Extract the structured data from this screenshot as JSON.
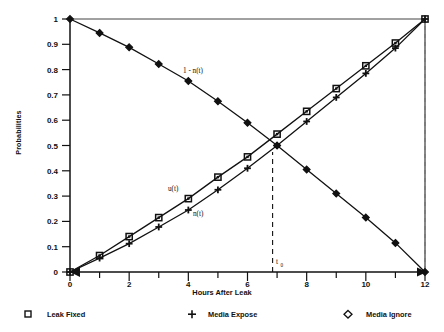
{
  "chart_data": {
    "type": "line",
    "title": "",
    "xlabel": "Hours After Leak",
    "ylabel": "Probabilities",
    "xlim": [
      0,
      12
    ],
    "ylim": [
      0,
      1
    ],
    "grid": false,
    "xticks": [
      0,
      1,
      2,
      3,
      4,
      5,
      6,
      7,
      8,
      9,
      10,
      11,
      12
    ],
    "xtick_labels": [
      "0",
      "",
      "2",
      "",
      "4",
      "",
      "6",
      "",
      "8",
      "",
      "10",
      "",
      "12"
    ],
    "yticks": [
      0,
      0.1,
      0.2,
      0.3,
      0.4,
      0.5,
      0.6,
      0.7,
      0.8,
      0.9,
      1
    ],
    "ytick_labels": [
      "0",
      "0.1",
      "0.2",
      "0.3",
      "0.4",
      "0.5",
      "0.6",
      "0.7",
      "0.8",
      "0.9",
      "1"
    ],
    "x": [
      0,
      1,
      2,
      3,
      4,
      5,
      6,
      7,
      8,
      9,
      10,
      11,
      12
    ],
    "series": [
      {
        "name": "Leak Fixed",
        "marker": "square",
        "curve_label": "u(t)",
        "values": [
          0.0,
          0.065,
          0.14,
          0.215,
          0.29,
          0.375,
          0.455,
          0.545,
          0.635,
          0.725,
          0.815,
          0.905,
          1.0
        ]
      },
      {
        "name": "Media Expose",
        "marker": "plus",
        "curve_label": "n(t)",
        "values": [
          0.0,
          0.055,
          0.112,
          0.178,
          0.245,
          0.325,
          0.41,
          0.5,
          0.595,
          0.69,
          0.785,
          0.885,
          1.0
        ]
      },
      {
        "name": "Media Ignore",
        "marker": "diamond",
        "curve_label": "1 - n(t)",
        "values": [
          1.0,
          0.945,
          0.888,
          0.822,
          0.755,
          0.675,
          0.59,
          0.5,
          0.405,
          0.31,
          0.215,
          0.115,
          0.0
        ]
      }
    ],
    "annotations": [
      {
        "name": "t-zero-marker",
        "text": "t",
        "subscript": "0",
        "x": 6.85,
        "y": 0.0
      }
    ],
    "reference_lines": [
      {
        "name": "t-zero-dashed-line",
        "orientation": "vertical",
        "x": 6.85,
        "style": "dashed"
      },
      {
        "name": "right-edge-dashed-line",
        "orientation": "vertical",
        "x": 12,
        "style": "dashed"
      }
    ],
    "legend_position": "below-plot",
    "colors": {
      "line": "#111111",
      "axis": "#111111",
      "background": "#ffffff"
    }
  },
  "legend": {
    "items": [
      {
        "label": "Leak Fixed",
        "glyph": "square-marker-icon"
      },
      {
        "label": "Media Expose",
        "glyph": "plus-marker-icon"
      },
      {
        "label": "Media Ignore",
        "glyph": "diamond-marker-icon"
      }
    ]
  },
  "axis": {
    "x_title": "Hours After Leak",
    "y_title": "Probabilities"
  },
  "curve_labels": {
    "descending": "1 - n(t)",
    "upper_ascending": "u(t)",
    "lower_ascending": "n(t)"
  },
  "t_zero": {
    "base": "t",
    "sub": "0"
  }
}
